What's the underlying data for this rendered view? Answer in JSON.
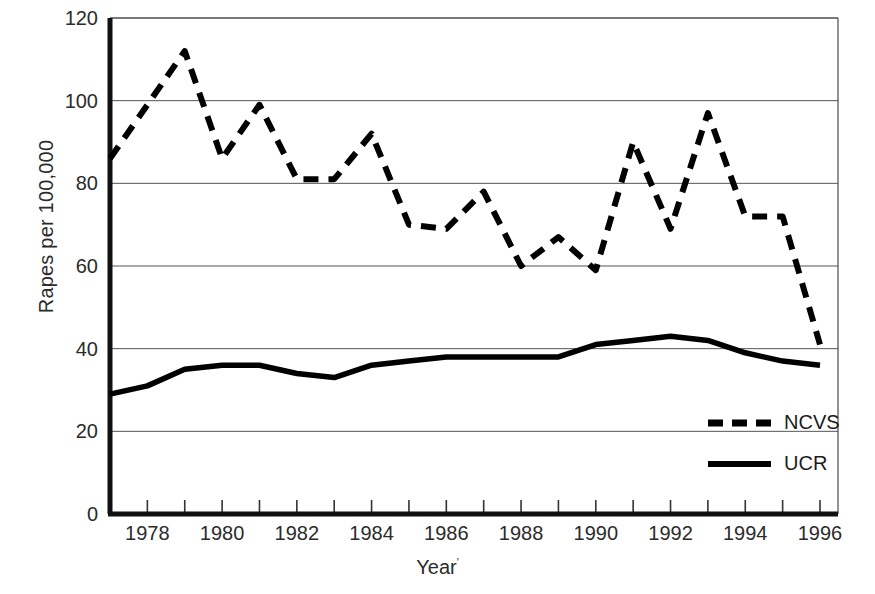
{
  "chart_data": {
    "type": "line",
    "title": "",
    "xlabel": "Year",
    "xlabel_superscript": "′",
    "ylabel": "Rapes per 100,000",
    "ylim": [
      0,
      120
    ],
    "yticks": [
      0,
      20,
      40,
      60,
      80,
      100,
      120
    ],
    "xlim": [
      1977,
      1996
    ],
    "xticks": [
      1977,
      1978,
      1979,
      1980,
      1981,
      1982,
      1983,
      1984,
      1985,
      1986,
      1987,
      1988,
      1989,
      1990,
      1991,
      1992,
      1993,
      1994,
      1995,
      1996
    ],
    "xtick_labels_shown": [
      1978,
      1980,
      1982,
      1984,
      1986,
      1988,
      1990,
      1992,
      1994,
      1996
    ],
    "grid": "horizontal",
    "legend_position": "inside-bottom-right",
    "x": [
      1977,
      1978,
      1979,
      1980,
      1981,
      1982,
      1983,
      1984,
      1985,
      1986,
      1987,
      1988,
      1989,
      1990,
      1991,
      1992,
      1993,
      1994,
      1995,
      1996
    ],
    "series": [
      {
        "name": "NCVS",
        "style": "dashed",
        "color": "#000000",
        "values": [
          86,
          99,
          112,
          86,
          99,
          81,
          81,
          92,
          70,
          69,
          78,
          60,
          67,
          59,
          90,
          69,
          97,
          72,
          72,
          41
        ]
      },
      {
        "name": "UCR",
        "style": "solid",
        "color": "#000000",
        "values": [
          29,
          31,
          35,
          36,
          36,
          34,
          33,
          36,
          37,
          38,
          38,
          38,
          38,
          41,
          42,
          43,
          42,
          39,
          37,
          36
        ]
      }
    ]
  },
  "legend": {
    "entries": [
      {
        "label": "NCVS",
        "style": "dashed"
      },
      {
        "label": "UCR",
        "style": "solid"
      }
    ]
  },
  "axis": {
    "y_tick_labels": [
      "120",
      "100",
      "80",
      "60",
      "40",
      "20",
      "0"
    ],
    "x_tick_labels": [
      "1978",
      "1980",
      "1982",
      "1984",
      "1986",
      "1988",
      "1990",
      "1992",
      "1994",
      "1996"
    ]
  }
}
